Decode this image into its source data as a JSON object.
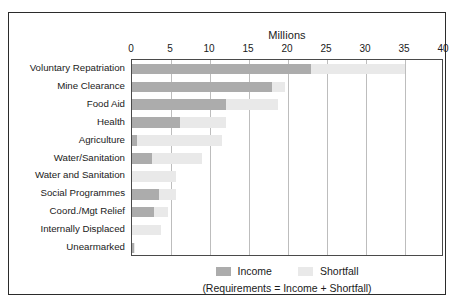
{
  "chart_data": {
    "type": "bar",
    "orientation": "horizontal",
    "stacked": true,
    "title": "Millions",
    "xlabel": "Millions",
    "ylabel": "",
    "xlim": [
      0,
      40
    ],
    "xticks": [
      0,
      5,
      10,
      15,
      20,
      25,
      30,
      35,
      40
    ],
    "grid": true,
    "legend_position": "bottom",
    "caption": "(Requirements = Income + Shortfall)",
    "categories": [
      "Voluntary Repatriation",
      "Mine Clearance",
      "Food Aid",
      "Health",
      "Agriculture",
      "Water/Sanitation",
      "Water and Sanitation",
      "Social Programmes",
      "Coord./Mgt Relief",
      "Internally Displaced",
      "Unearmarked"
    ],
    "series": [
      {
        "name": "Income",
        "color": "#acacac",
        "values": [
          23.0,
          18.0,
          12.0,
          6.1,
          0.7,
          2.6,
          0.0,
          3.4,
          2.8,
          0.0,
          0.3
        ]
      },
      {
        "name": "Shortfall",
        "color": "#e9e9e9",
        "values": [
          12.0,
          1.6,
          6.7,
          6.0,
          10.8,
          6.4,
          5.6,
          2.2,
          1.8,
          3.7,
          0.1
        ]
      }
    ],
    "totals": [
      35.0,
      19.6,
      18.7,
      12.1,
      11.5,
      9.0,
      5.6,
      5.6,
      4.6,
      3.7,
      0.4
    ]
  },
  "legend": {
    "income_label": "Income",
    "shortfall_label": "Shortfall"
  }
}
